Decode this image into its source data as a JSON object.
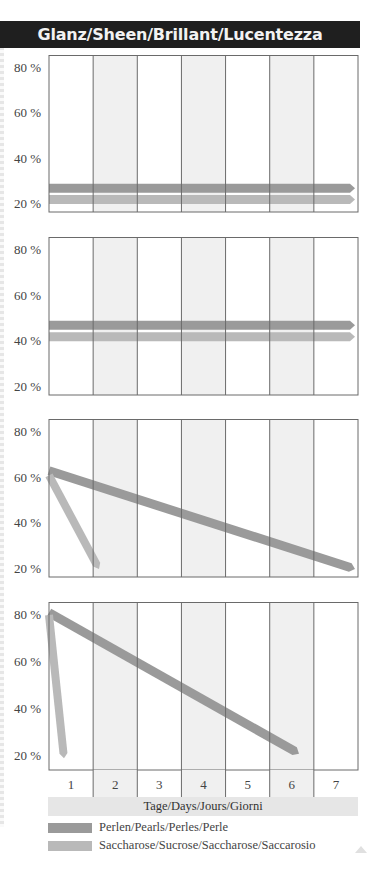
{
  "title": "Glanz/Sheen/Brillant/Lucentezza",
  "colors": {
    "perlen": "#9a9a9a",
    "saccharose": "#b9b9b9",
    "shaded_column": "#f0f0f0",
    "title_bg": "#1f1f1f",
    "axis_band": "#e6e6e6"
  },
  "y_tick_labels": [
    "80 %",
    "60 %",
    "40 %",
    "20 %"
  ],
  "x_axis": {
    "ticks": [
      "1",
      "2",
      "3",
      "4",
      "5",
      "6",
      "7"
    ],
    "label": "Tage/Days/Jours/Giorni"
  },
  "legend": [
    {
      "key": "perlen",
      "label": "Perlen/Pearls/Perles/Perle"
    },
    {
      "key": "saccharose",
      "label": "Saccharose/Sucrose/Saccharose/Saccarosio"
    }
  ],
  "chart_data": [
    {
      "type": "line",
      "title": "Glanz/Sheen/Brillant/Lucentezza — panel 1",
      "xlabel": "Tage/Days/Jours/Giorni",
      "ylabel": "%",
      "ylim": [
        20,
        80
      ],
      "x": [
        1,
        2,
        3,
        4,
        5,
        6,
        7
      ],
      "series": [
        {
          "name": "Perlen/Pearls/Perles/Perle",
          "points": [
            [
              1,
              27
            ],
            [
              7,
              27
            ]
          ]
        },
        {
          "name": "Saccharose/Sucrose/Saccharose/Saccarosio",
          "points": [
            [
              1,
              22
            ],
            [
              7,
              22
            ]
          ]
        }
      ]
    },
    {
      "type": "line",
      "title": "panel 2",
      "ylim": [
        20,
        80
      ],
      "x": [
        1,
        2,
        3,
        4,
        5,
        6,
        7
      ],
      "series": [
        {
          "name": "Perlen/Pearls/Perles/Perle",
          "points": [
            [
              1,
              47
            ],
            [
              7,
              47
            ]
          ]
        },
        {
          "name": "Saccharose/Sucrose/Saccharose/Saccarosio",
          "points": [
            [
              1,
              42
            ],
            [
              7,
              42
            ]
          ]
        }
      ]
    },
    {
      "type": "line",
      "title": "panel 3",
      "ylim": [
        20,
        80
      ],
      "x": [
        1,
        2,
        3,
        4,
        5,
        6,
        7
      ],
      "series": [
        {
          "name": "Perlen/Pearls/Perles/Perle",
          "points": [
            [
              1,
              63
            ],
            [
              7,
              20
            ]
          ]
        },
        {
          "name": "Saccharose/Sucrose/Saccharose/Saccarosio",
          "points": [
            [
              1,
              61
            ],
            [
              2,
              20
            ]
          ]
        }
      ]
    },
    {
      "type": "line",
      "title": "panel 4",
      "ylim": [
        20,
        80
      ],
      "x": [
        1,
        2,
        3,
        4,
        5,
        6,
        7
      ],
      "series": [
        {
          "name": "Perlen/Pearls/Perles/Perle",
          "points": [
            [
              1,
              81
            ],
            [
              6,
              21
            ]
          ]
        },
        {
          "name": "Saccharose/Sucrose/Saccharose/Saccarosio",
          "points": [
            [
              1,
              80
            ],
            [
              1.3,
              19
            ]
          ]
        }
      ]
    }
  ]
}
